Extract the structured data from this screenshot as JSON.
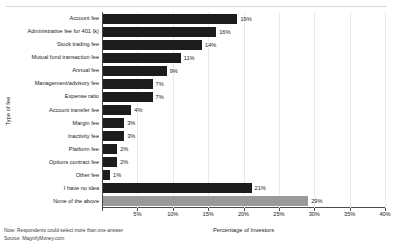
{
  "chart_data": {
    "type": "bar",
    "orientation": "horizontal",
    "title": "",
    "xlabel": "Percentage of Investors",
    "ylabel": "Type of fee",
    "xlim": [
      0,
      40
    ],
    "xticks": [
      "0%",
      "5%",
      "10%",
      "15%",
      "20%",
      "25%",
      "30%",
      "35%",
      "40%"
    ],
    "xtick_values": [
      0,
      5,
      10,
      15,
      20,
      25,
      30,
      35,
      40
    ],
    "grid": true,
    "legend": "none",
    "categories": [
      "Account fee",
      "Administrative fee for 401 (k)",
      "Stock trading fee",
      "Mutual fund transaction fee",
      "Annual fee",
      "Management/advisory fee",
      "Expense ratio",
      "Account transfer fee",
      "Margin fee",
      "Inactivity fee",
      "Platform fee",
      "Options contract fee",
      "Other fee",
      "I have no idea",
      "None of the above"
    ],
    "values": [
      19,
      16,
      14,
      11,
      9,
      7,
      7,
      4,
      3,
      3,
      2,
      2,
      1,
      21,
      29
    ],
    "data_labels": [
      "19%",
      "16%",
      "14%",
      "11%",
      "9%",
      "7%",
      "7%",
      "4%",
      "3%",
      "3%",
      "2%",
      "2%",
      "1%",
      "21%",
      "29%"
    ],
    "bar_colors": [
      "#1c1c1c",
      "#1c1c1c",
      "#1c1c1c",
      "#1c1c1c",
      "#1c1c1c",
      "#1c1c1c",
      "#1c1c1c",
      "#1c1c1c",
      "#1c1c1c",
      "#1c1c1c",
      "#1c1c1c",
      "#1c1c1c",
      "#1c1c1c",
      "#1c1c1c",
      "#9a9a9a"
    ],
    "colors": {
      "primary_bar": "#1c1c1c",
      "highlight_bar": "#9a9a9a",
      "grid": "#e9e9e9",
      "axis": "#4a4a4a",
      "background": "#ffffff"
    }
  },
  "footnotes": {
    "note": "Note: Respondents could select more than one answer",
    "source": "Source: MagnifyMoney.com"
  }
}
